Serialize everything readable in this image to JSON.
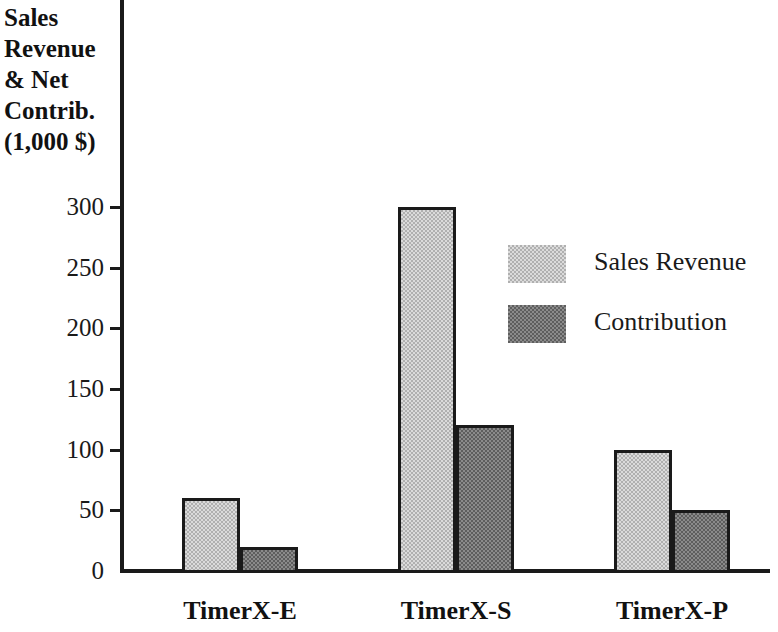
{
  "chart_data": {
    "type": "bar",
    "title": "",
    "subtitle": "",
    "xlabel": "",
    "ylabel": "Sales Revenue & Net Contrib. (1,000 $)",
    "ylabel_lines": [
      "Sales",
      "Revenue",
      "& Net",
      "Contrib.",
      "(1,000 $)"
    ],
    "categories": [
      "TimerX-E",
      "TimerX-S",
      "TimerX-P"
    ],
    "series": [
      {
        "name": "Sales Revenue",
        "values": [
          60,
          300,
          100
        ],
        "color": "#b0b0b0"
      },
      {
        "name": "Contribution",
        "values": [
          20,
          120,
          50
        ],
        "color": "#5e5e5e"
      }
    ],
    "ylim": [
      0,
      300
    ],
    "y_ticks": [
      0,
      50,
      100,
      150,
      200,
      250,
      300
    ],
    "y_tick_labels": [
      "0",
      "50",
      "100",
      "150",
      "200",
      "250",
      "300"
    ],
    "grid": false,
    "legend_position": "upper right",
    "legend_entries": [
      "Sales Revenue",
      "Contribution"
    ],
    "axis_color": "#1a1a1a",
    "background": "#ffffff"
  }
}
